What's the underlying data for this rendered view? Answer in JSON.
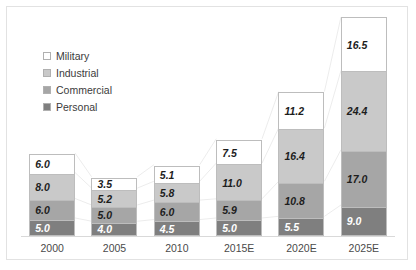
{
  "chart_data": {
    "type": "bar",
    "subtype": "stacked-column",
    "title": "",
    "xlabel": "",
    "ylabel": "",
    "grid": false,
    "legend_position": "inside-upper-left",
    "axis_visible": {
      "x": true,
      "y": false
    },
    "ylim": [
      0,
      66.9
    ],
    "categories": [
      "2000",
      "2005",
      "2010",
      "2015E",
      "2020E",
      "2025E"
    ],
    "series": [
      {
        "name": "Personal",
        "color": "#7f7f7f",
        "values": [
          5.0,
          4.0,
          4.5,
          5.0,
          5.5,
          9.0
        ]
      },
      {
        "name": "Commercial",
        "color": "#a6a6a6",
        "values": [
          6.0,
          5.0,
          6.0,
          5.9,
          10.8,
          17.0
        ]
      },
      {
        "name": "Industrial",
        "color": "#c9c9c9",
        "values": [
          8.0,
          5.2,
          5.8,
          11.0,
          16.4,
          24.4
        ]
      },
      {
        "name": "Military",
        "color": "#ffffff",
        "values": [
          6.0,
          3.5,
          5.1,
          7.5,
          11.2,
          16.5
        ]
      }
    ],
    "stack_order_bottom_to_top": [
      "Personal",
      "Commercial",
      "Industrial",
      "Military"
    ],
    "data_labels": {
      "2000": {
        "Personal": "5.0",
        "Commercial": "6.0",
        "Industrial": "8.0",
        "Military": "6.0"
      },
      "2005": {
        "Personal": "4.0",
        "Commercial": "5.0",
        "Industrial": "5.2",
        "Military": "3.5"
      },
      "2010": {
        "Personal": "4.5",
        "Commercial": "6.0",
        "Industrial": "5.8",
        "Military": "5.1"
      },
      "2015E": {
        "Personal": "5.0",
        "Commercial": "5.9",
        "Industrial": "11.0",
        "Military": "7.5"
      },
      "2020E": {
        "Personal": "5.5",
        "Commercial": "10.8",
        "Industrial": "16.4",
        "Military": "11.2"
      },
      "2025E": {
        "Personal": "9.0",
        "Commercial": "17.0",
        "Industrial": "24.4",
        "Military": "16.5"
      }
    },
    "totals": [
      25.0,
      17.7,
      21.4,
      29.4,
      43.9,
      66.9
    ]
  },
  "legend": {
    "items": [
      {
        "label": "Military",
        "color": "#ffffff"
      },
      {
        "label": "Industrial",
        "color": "#c9c9c9"
      },
      {
        "label": "Commercial",
        "color": "#a6a6a6"
      },
      {
        "label": "Personal",
        "color": "#7f7f7f"
      }
    ]
  }
}
